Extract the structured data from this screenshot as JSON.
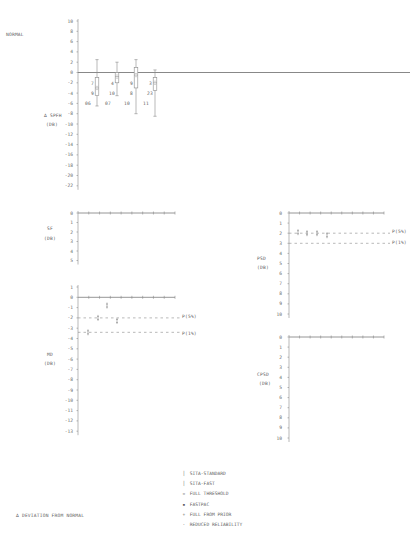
{
  "chart_data": [
    {
      "type": "box",
      "id": "normal",
      "title": "NORMAL",
      "ylabel": "∆ SPFH (DB)",
      "ylabel_lines": [
        "∆ SPFH",
        "(DB)"
      ],
      "ylim": [
        -22,
        10
      ],
      "yticks": [
        "10",
        "8",
        "6",
        "4",
        "2",
        "0",
        "-2",
        "-4",
        "-6",
        "-8",
        "-10",
        "-12",
        "-14",
        "-16",
        "-18",
        "-20",
        "-22"
      ],
      "grid": false,
      "series": [
        {
          "date_lines": [
            "7",
            "9",
            "06"
          ],
          "date": "7/9/06",
          "whisker_high": 2.5,
          "q3": -1.0,
          "median": -3.0,
          "q1": -4.5,
          "whisker_low": -6.5
        },
        {
          "date_lines": [
            "4",
            "10",
            "07"
          ],
          "date": "4/10/07",
          "whisker_high": 2.0,
          "q3": 0.0,
          "median": -0.8,
          "q1": -2.0,
          "whisker_low": -4.5
        },
        {
          "date_lines": [
            "9",
            "8",
            "10"
          ],
          "date": "9/8/10",
          "whisker_high": 2.5,
          "q3": 1.0,
          "median": -0.5,
          "q1": -3.0,
          "whisker_low": -8.0
        },
        {
          "date_lines": [
            "3",
            "23",
            "11"
          ],
          "date": "3/23/11",
          "whisker_high": 0.5,
          "q3": -1.0,
          "median": -2.0,
          "q1": -3.5,
          "whisker_low": -8.5
        }
      ]
    },
    {
      "type": "line",
      "id": "sf",
      "ylabel_lines": [
        "SF",
        "(DB)"
      ],
      "ylim": [
        5,
        0
      ],
      "yticks": [
        "0",
        "1",
        "2",
        "3",
        "4",
        "5"
      ],
      "values": [
        0,
        0,
        0,
        0,
        0,
        0,
        0,
        0,
        0
      ],
      "grid": false
    },
    {
      "type": "scatter",
      "id": "md",
      "ylabel_lines": [
        "MD",
        "(DB)"
      ],
      "ylim": [
        -13,
        1
      ],
      "yticks": [
        "1",
        "0",
        "-1",
        "-2",
        "-3",
        "-4",
        "-5",
        "-6",
        "-7",
        "-8",
        "-9",
        "-10",
        "-11",
        "-12",
        "-13"
      ],
      "points": [
        {
          "x": 1,
          "y": -3.4
        },
        {
          "x": 2,
          "y": -2.0
        },
        {
          "x": 3,
          "y": -0.8
        },
        {
          "x": 4,
          "y": -2.3
        }
      ],
      "reference_lines": [
        {
          "label": "P(5%)",
          "y": -2.0
        },
        {
          "label": "P(1%)",
          "y": -3.4
        }
      ]
    },
    {
      "type": "scatter",
      "id": "psd",
      "ylabel_lines": [
        "PSD",
        "(DB)"
      ],
      "ylim": [
        10,
        0
      ],
      "yticks": [
        "0",
        "1",
        "2",
        "3",
        "4",
        "5",
        "6",
        "7",
        "8",
        "9",
        "10"
      ],
      "points": [
        {
          "x": 1,
          "y": 1.9
        },
        {
          "x": 2,
          "y": 2.0
        },
        {
          "x": 3,
          "y": 2.0
        },
        {
          "x": 4,
          "y": 2.2
        }
      ],
      "reference_lines": [
        {
          "label": "P(5%)",
          "y": 2.0
        },
        {
          "label": "P(1%)",
          "y": 3.0
        }
      ]
    },
    {
      "type": "line",
      "id": "cpsd",
      "ylabel_lines": [
        "CPSD",
        "(DB)"
      ],
      "ylim": [
        10,
        0
      ],
      "yticks": [
        "0",
        "1",
        "2",
        "3",
        "4",
        "5",
        "6",
        "7",
        "8",
        "9",
        "10"
      ],
      "values": [
        0,
        0,
        0,
        0,
        0,
        0,
        0,
        0,
        0
      ]
    }
  ],
  "legend": {
    "items": [
      {
        "symbol": "│",
        "label": "SITA-STANDARD"
      },
      {
        "symbol": "│",
        "label": "SITA-FAST"
      },
      {
        "symbol": "▫",
        "label": "FULL THRESHOLD"
      },
      {
        "symbol": "▪",
        "label": "FASTPAC"
      },
      {
        "symbol": "+",
        "label": "FULL FROM PRIOR"
      },
      {
        "symbol": "·",
        "label": "REDUCED RELIABILITY"
      }
    ]
  },
  "footer": {
    "note": "∆ DEVIATION FROM NORMAL"
  },
  "colors": {
    "ink": "#6a6a6a",
    "axis": "#8a8a8a",
    "background": "#ffffff"
  }
}
